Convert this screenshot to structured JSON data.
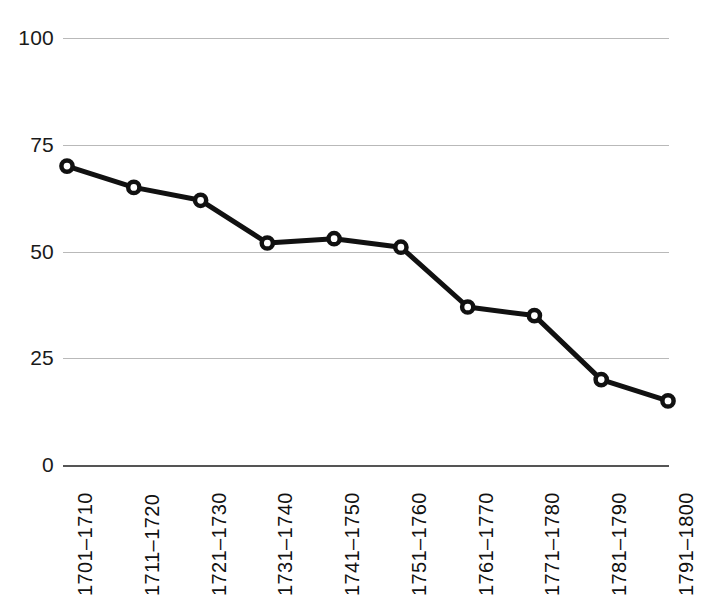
{
  "chart_data": {
    "type": "line",
    "title": "",
    "subtitle": "",
    "xlabel": "",
    "ylabel": "",
    "categories": [
      "1701–1710",
      "1711–1720",
      "1721–1730",
      "1731–1740",
      "1741–1750",
      "1751–1760",
      "1761–1770",
      "1771–1780",
      "1781–1790",
      "1791–1800"
    ],
    "values": [
      70,
      65,
      62,
      52,
      53,
      51,
      37,
      35,
      20,
      15
    ],
    "ylim": [
      0,
      100
    ],
    "yticks": [
      0,
      25,
      50,
      75,
      100
    ],
    "ytick_labels": [
      "0",
      "25",
      "50",
      "75",
      "100"
    ],
    "grid": true,
    "grid_axis": "y",
    "legend": "none",
    "series": [
      {
        "name": "series-1",
        "color": "#111111",
        "marker": "circle-open",
        "values": [
          70,
          65,
          62,
          52,
          53,
          51,
          37,
          35,
          20,
          15
        ]
      }
    ],
    "colors": {
      "line": "#111111",
      "marker_fill": "#ffffff",
      "gridline": "#b9b9b9",
      "axis": "#555555",
      "text": "#111111",
      "background": "#ffffff"
    }
  }
}
